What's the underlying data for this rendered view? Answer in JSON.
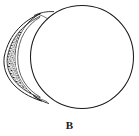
{
  "figure": {
    "caption": "B",
    "background_color": "#ffffff",
    "ink_color": "#1a1a1a",
    "parts": [
      {
        "name": "main-circle",
        "label": "circular body outline",
        "shape": "circle",
        "center_x": 82,
        "center_y": 57,
        "radius": 52,
        "stroke": "#1a1a1a",
        "stroke_width": 1.1,
        "fill": "#ffffff"
      },
      {
        "name": "crescent-lug",
        "label": "crescent shaped textured handle",
        "shape": "lunate",
        "tip_top_x": 40,
        "tip_top_y": 14,
        "tip_bottom_x": 42,
        "tip_bottom_y": 101,
        "outer_extent_x": 3,
        "outer_extent_y": 58,
        "stroke": "#1a1a1a",
        "stroke_width": 1,
        "fill": "#ffffff",
        "texture": "stipple-hatch"
      },
      {
        "name": "crescent-inner-band",
        "label": "inner textured band of crescent",
        "shape": "arc-band",
        "texture": "short-dash-hatching",
        "fill": "#2a2a2a"
      }
    ]
  }
}
